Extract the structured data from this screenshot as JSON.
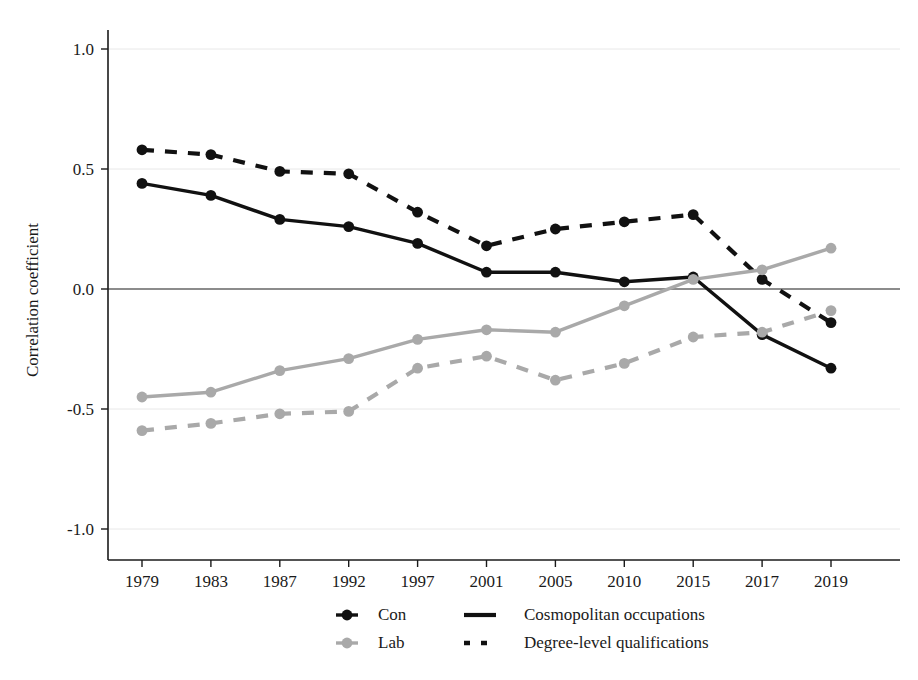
{
  "chart_data": {
    "type": "line",
    "title": "",
    "xlabel": "",
    "ylabel": "Correlation coefficient",
    "categories": [
      "1979",
      "1983",
      "1987",
      "1992",
      "1997",
      "2001",
      "2005",
      "2010",
      "2015",
      "2017",
      "2019"
    ],
    "ylim": [
      -1.25,
      1.15
    ],
    "yticks": [
      "1.0",
      "0.5",
      "0.0",
      "-0.5",
      "-1.0"
    ],
    "ytick_values": [
      1.0,
      0.5,
      0.0,
      -0.5,
      -1.0
    ],
    "grid": "horizontal-light",
    "zero_line": true,
    "legend_position": "bottom-center",
    "colors": {
      "con": "#111111",
      "lab": "#a9a9a9",
      "grid": "#e8e8e8",
      "axis": "#1a1a1a"
    },
    "series": [
      {
        "name": "Con – Cosmopolitan occupations",
        "party": "Con",
        "measure": "Cosmopolitan occupations",
        "color": "#111111",
        "dash": "solid",
        "values": [
          0.44,
          0.39,
          0.29,
          0.26,
          0.19,
          0.07,
          0.07,
          0.03,
          0.05,
          -0.19,
          -0.33
        ]
      },
      {
        "name": "Con – Degree-level qualifications",
        "party": "Con",
        "measure": "Degree-level qualifications",
        "color": "#111111",
        "dash": "dashed",
        "values": [
          0.58,
          0.56,
          0.49,
          0.48,
          0.32,
          0.18,
          0.25,
          0.28,
          0.31,
          0.04,
          -0.14
        ]
      },
      {
        "name": "Lab – Cosmopolitan occupations",
        "party": "Lab",
        "measure": "Cosmopolitan occupations",
        "color": "#a9a9a9",
        "dash": "solid",
        "values": [
          -0.45,
          -0.43,
          -0.34,
          -0.29,
          -0.21,
          -0.17,
          -0.18,
          -0.07,
          0.04,
          0.08,
          0.17
        ]
      },
      {
        "name": "Lab – Degree-level qualifications",
        "party": "Lab",
        "measure": "Degree-level qualifications",
        "color": "#a9a9a9",
        "dash": "dashed",
        "values": [
          -0.59,
          -0.56,
          -0.52,
          -0.51,
          -0.33,
          -0.28,
          -0.38,
          -0.31,
          -0.2,
          -0.18,
          -0.09
        ]
      }
    ],
    "legend": {
      "party_entries": [
        {
          "label": "Con",
          "color": "#111111"
        },
        {
          "label": "Lab",
          "color": "#a9a9a9"
        }
      ],
      "measure_entries": [
        {
          "label": "Cosmopolitan occupations",
          "dash": "solid"
        },
        {
          "label": "Degree-level qualifications",
          "dash": "dashed"
        }
      ]
    }
  }
}
